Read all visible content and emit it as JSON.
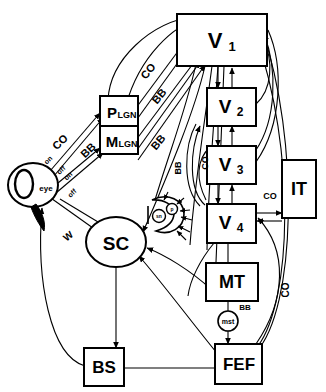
{
  "diagram": {
    "nodes": [
      {
        "id": "eye",
        "label": "eye",
        "shape": "eye-circle"
      },
      {
        "id": "plgn",
        "label": "P",
        "subscript": "LGN",
        "shape": "rect"
      },
      {
        "id": "mlgn",
        "label": "M",
        "subscript": "LGN",
        "shape": "rect"
      },
      {
        "id": "v1",
        "label": "V",
        "subscript": "1",
        "shape": "rect"
      },
      {
        "id": "v2",
        "label": "V",
        "subscript": "2",
        "shape": "rect"
      },
      {
        "id": "v3",
        "label": "V",
        "subscript": "3",
        "shape": "rect"
      },
      {
        "id": "v4",
        "label": "V",
        "subscript": "4",
        "shape": "rect"
      },
      {
        "id": "it",
        "label": "IT",
        "shape": "rect"
      },
      {
        "id": "mt",
        "label": "MT",
        "shape": "rect"
      },
      {
        "id": "mst",
        "label": "mst",
        "shape": "circle"
      },
      {
        "id": "fef",
        "label": "FEF",
        "shape": "rect"
      },
      {
        "id": "bs",
        "label": "BS",
        "shape": "rect"
      },
      {
        "id": "sc",
        "label": "SC",
        "shape": "ellipse"
      },
      {
        "id": "pulv",
        "label": "pulvinar",
        "shape": "crescent"
      },
      {
        "id": "sn",
        "label": "sn",
        "shape": "circle"
      },
      {
        "id": "pul2",
        "label": "p",
        "shape": "circle"
      }
    ],
    "edge_labels": [
      {
        "id": "co-retina-lgn",
        "text": "CO"
      },
      {
        "id": "on-1",
        "text": "on"
      },
      {
        "id": "off-1",
        "text": "off"
      },
      {
        "id": "bb-retina-lgn",
        "text": "BB"
      },
      {
        "id": "on-2",
        "text": "on"
      },
      {
        "id": "off-2",
        "text": "off"
      },
      {
        "id": "w-retina-sc",
        "text": "W"
      },
      {
        "id": "co-lgn-v1",
        "text": "CO"
      },
      {
        "id": "bb-lgn-v1a",
        "text": "BB"
      },
      {
        "id": "bb-lgn-v1b",
        "text": "BB"
      },
      {
        "id": "bb-mid",
        "text": "BB"
      },
      {
        "id": "co-mid",
        "text": "CO"
      },
      {
        "id": "co-v4-it",
        "text": "CO"
      },
      {
        "id": "bb-mt-mst",
        "text": "BB"
      },
      {
        "id": "co-right",
        "text": "CO"
      }
    ],
    "node_text": {
      "eye": "eye",
      "plgn_main": "P",
      "plgn_sub": "LGN",
      "mlgn_main": "M",
      "mlgn_sub": "LGN",
      "v1_main": "V",
      "v1_sub": "1",
      "v2_main": "V",
      "v2_sub": "2",
      "v3_main": "V",
      "v3_sub": "3",
      "v4_main": "V",
      "v4_sub": "4",
      "it": "IT",
      "mt": "MT",
      "mst": "mst",
      "fef": "FEF",
      "bs": "BS",
      "sc": "SC",
      "sn": "sn",
      "pul": "p"
    },
    "colors": {
      "stroke": "#000000",
      "fill": "#ffffff",
      "background": "#ffffff"
    }
  }
}
